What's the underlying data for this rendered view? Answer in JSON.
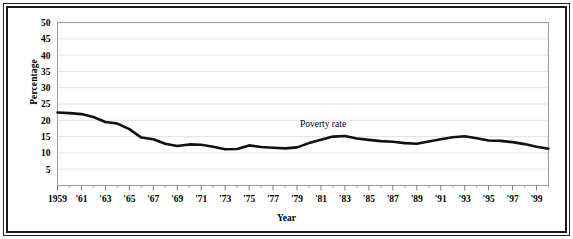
{
  "chart_data": {
    "type": "line",
    "title": "",
    "xlabel": "Year",
    "ylabel": "Percentage",
    "xlim": [
      1959,
      2000
    ],
    "ylim": [
      0,
      50
    ],
    "yticks": [
      5,
      10,
      15,
      20,
      25,
      30,
      35,
      40,
      45,
      50
    ],
    "ytick_labels": [
      "5",
      "10",
      "15",
      "20",
      "25",
      "30",
      "35",
      "40",
      "45",
      "50"
    ],
    "xticks": [
      1959,
      1961,
      1963,
      1965,
      1967,
      1969,
      1971,
      1973,
      1975,
      1977,
      1979,
      1981,
      1983,
      1985,
      1987,
      1989,
      1991,
      1993,
      1995,
      1997,
      1999
    ],
    "xtick_labels": [
      "1959",
      "'61",
      "'63",
      "'65",
      "'67",
      "'69",
      "'71",
      "'73",
      "'75",
      "'77",
      "'79",
      "'81",
      "'83",
      "'85",
      "'87",
      "'89",
      "'91",
      "'93",
      "'95",
      "'97",
      "'99"
    ],
    "grid": "horizontal",
    "legend_position": "inline-annotation",
    "line_color": "#111111",
    "grid_color": "#e3e3e3",
    "axis_color": "#9a9a9a",
    "series": [
      {
        "name": "Poverty rate",
        "annotation": "Poverty rate",
        "annotation_x": 1982,
        "annotation_y": 18.7,
        "x": [
          1959,
          1960,
          1961,
          1962,
          1963,
          1964,
          1965,
          1966,
          1967,
          1968,
          1969,
          1970,
          1971,
          1972,
          1973,
          1974,
          1975,
          1976,
          1977,
          1978,
          1979,
          1980,
          1981,
          1982,
          1983,
          1984,
          1985,
          1986,
          1987,
          1988,
          1989,
          1990,
          1991,
          1992,
          1993,
          1994,
          1995,
          1996,
          1997,
          1998,
          1999,
          2000
        ],
        "values": [
          22.4,
          22.2,
          21.9,
          21.0,
          19.5,
          19.0,
          17.3,
          14.7,
          14.2,
          12.8,
          12.1,
          12.6,
          12.5,
          11.9,
          11.1,
          11.2,
          12.3,
          11.8,
          11.6,
          11.4,
          11.7,
          13.0,
          14.0,
          15.0,
          15.2,
          14.4,
          14.0,
          13.6,
          13.4,
          13.0,
          12.8,
          13.5,
          14.2,
          14.8,
          15.1,
          14.5,
          13.8,
          13.7,
          13.3,
          12.7,
          11.9,
          11.3
        ]
      }
    ]
  },
  "axes": {
    "y_title": "Percentage",
    "x_title": "Year"
  }
}
